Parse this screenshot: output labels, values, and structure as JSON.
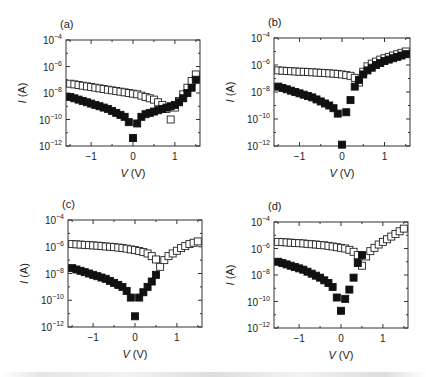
{
  "figure": {
    "panels": [
      {
        "id": "a",
        "label": "(a)"
      },
      {
        "id": "b",
        "label": "(b)"
      },
      {
        "id": "c",
        "label": "(c)"
      },
      {
        "id": "d",
        "label": "(d)"
      }
    ],
    "xlabel": "V (V)",
    "ylabel": "I (A)",
    "x_ticks": [
      "−1",
      "0",
      "1"
    ],
    "y_ticks": [
      "10⁻¹²",
      "10⁻¹⁰",
      "10⁻⁸",
      "10⁻⁶",
      "10⁻⁴"
    ],
    "colors": {
      "axis": "#222222",
      "filled_marker": "#111111",
      "open_marker_stroke": "#222222",
      "open_marker_fill": "#ffffff"
    }
  },
  "chart_data": [
    {
      "panel": "(a)",
      "type": "scatter",
      "title": "(a)",
      "xlabel": "V (V)",
      "ylabel": "I (A)",
      "yscale": "log",
      "xlim": [
        -1.6,
        1.6
      ],
      "ylim": [
        1e-12,
        0.0001
      ],
      "x_ticks": [
        -1,
        0,
        1
      ],
      "y_ticks": [
        1e-12,
        1e-10,
        1e-08,
        1e-06,
        0.0001
      ],
      "grid": false,
      "series": [
        {
          "name": "open squares",
          "marker": "open-square",
          "x": [
            -1.5,
            -1.4,
            -1.3,
            -1.2,
            -1.1,
            -1.0,
            -0.9,
            -0.8,
            -0.7,
            -0.6,
            -0.5,
            -0.4,
            -0.3,
            -0.2,
            -0.1,
            0.0,
            0.1,
            0.2,
            0.3,
            0.4,
            0.5,
            0.6,
            0.7,
            0.8,
            0.9,
            1.0,
            1.1,
            1.2,
            1.3,
            1.4,
            1.5
          ],
          "log10_y": [
            -7.3,
            -7.35,
            -7.4,
            -7.45,
            -7.5,
            -7.55,
            -7.6,
            -7.65,
            -7.7,
            -7.75,
            -7.8,
            -7.85,
            -7.9,
            -7.95,
            -8.0,
            -8.05,
            -8.1,
            -8.2,
            -8.3,
            -8.4,
            -8.5,
            -8.7,
            -8.9,
            -9.2,
            -10.0,
            -9.1,
            -8.6,
            -8.1,
            -7.6,
            -7.1,
            -6.6
          ]
        },
        {
          "name": "filled squares",
          "marker": "filled-square",
          "x": [
            -1.5,
            -1.4,
            -1.3,
            -1.2,
            -1.1,
            -1.0,
            -0.9,
            -0.8,
            -0.7,
            -0.6,
            -0.5,
            -0.4,
            -0.3,
            -0.2,
            -0.1,
            0.0,
            0.1,
            0.2,
            0.3,
            0.4,
            0.5,
            0.6,
            0.7,
            0.8,
            0.9,
            1.0,
            1.1,
            1.2,
            1.3,
            1.4,
            1.5
          ],
          "log10_y": [
            -8.3,
            -8.4,
            -8.5,
            -8.6,
            -8.7,
            -8.8,
            -8.9,
            -9.0,
            -9.1,
            -9.2,
            -9.35,
            -9.5,
            -9.65,
            -9.8,
            -10.2,
            -11.4,
            -10.3,
            -9.8,
            -9.6,
            -9.5,
            -9.4,
            -9.3,
            -9.2,
            -9.1,
            -9.0,
            -8.9,
            -8.7,
            -8.4,
            -8.0,
            -7.6,
            -7.0
          ]
        }
      ]
    },
    {
      "panel": "(b)",
      "type": "scatter",
      "title": "(b)",
      "xlabel": "V (V)",
      "ylabel": "I (A)",
      "yscale": "log",
      "xlim": [
        -1.6,
        1.6
      ],
      "ylim": [
        1e-12,
        0.0001
      ],
      "x_ticks": [
        -1,
        0,
        1
      ],
      "y_ticks": [
        1e-12,
        1e-10,
        1e-08,
        1e-06,
        0.0001
      ],
      "grid": false,
      "series": [
        {
          "name": "open squares",
          "marker": "open-square",
          "x": [
            -1.5,
            -1.4,
            -1.3,
            -1.2,
            -1.1,
            -1.0,
            -0.9,
            -0.8,
            -0.7,
            -0.6,
            -0.5,
            -0.4,
            -0.3,
            -0.2,
            -0.1,
            0.0,
            0.1,
            0.2,
            0.3,
            0.4,
            0.5,
            0.6,
            0.7,
            0.8,
            0.9,
            1.0,
            1.1,
            1.2,
            1.3,
            1.4,
            1.5
          ],
          "log10_y": [
            -6.4,
            -6.42,
            -6.44,
            -6.46,
            -6.48,
            -6.5,
            -6.5,
            -6.52,
            -6.54,
            -6.56,
            -6.58,
            -6.6,
            -6.62,
            -6.64,
            -6.66,
            -6.7,
            -6.75,
            -6.8,
            -6.95,
            -7.3,
            -6.5,
            -6.1,
            -5.9,
            -5.75,
            -5.6,
            -5.5,
            -5.4,
            -5.3,
            -5.2,
            -5.1,
            -5.0
          ]
        },
        {
          "name": "filled squares",
          "marker": "filled-square",
          "x": [
            -1.5,
            -1.4,
            -1.3,
            -1.2,
            -1.1,
            -1.0,
            -0.9,
            -0.8,
            -0.7,
            -0.6,
            -0.5,
            -0.4,
            -0.3,
            -0.2,
            -0.1,
            0.0,
            0.1,
            0.2,
            0.3,
            0.4,
            0.5,
            0.6,
            0.7,
            0.8,
            0.9,
            1.0,
            1.1,
            1.2,
            1.3,
            1.4,
            1.5
          ],
          "log10_y": [
            -7.6,
            -7.7,
            -7.8,
            -7.9,
            -8.0,
            -8.1,
            -8.2,
            -8.3,
            -8.4,
            -8.55,
            -8.7,
            -8.85,
            -9.0,
            -9.2,
            -9.6,
            -11.9,
            -9.5,
            -8.6,
            -7.6,
            -7.1,
            -6.7,
            -6.4,
            -6.2,
            -6.0,
            -5.85,
            -5.7,
            -5.6,
            -5.5,
            -5.4,
            -5.3,
            -5.2
          ]
        }
      ]
    },
    {
      "panel": "(c)",
      "type": "scatter",
      "title": "(c)",
      "xlabel": "V (V)",
      "ylabel": "I (A)",
      "yscale": "log",
      "xlim": [
        -1.6,
        1.6
      ],
      "ylim": [
        1e-12,
        0.0001
      ],
      "x_ticks": [
        -1,
        0,
        1
      ],
      "y_ticks": [
        1e-12,
        1e-10,
        1e-08,
        1e-06,
        0.0001
      ],
      "grid": false,
      "series": [
        {
          "name": "open squares",
          "marker": "open-square",
          "x": [
            -1.5,
            -1.4,
            -1.3,
            -1.2,
            -1.1,
            -1.0,
            -0.9,
            -0.8,
            -0.7,
            -0.6,
            -0.5,
            -0.4,
            -0.3,
            -0.2,
            -0.1,
            0.0,
            0.1,
            0.2,
            0.3,
            0.4,
            0.5,
            0.6,
            0.7,
            0.8,
            0.9,
            1.0,
            1.1,
            1.2,
            1.3,
            1.4,
            1.5
          ],
          "log10_y": [
            -5.8,
            -5.82,
            -5.84,
            -5.86,
            -5.88,
            -5.9,
            -5.92,
            -5.95,
            -5.98,
            -6.0,
            -6.03,
            -6.06,
            -6.1,
            -6.14,
            -6.2,
            -6.25,
            -6.32,
            -6.4,
            -6.5,
            -6.7,
            -6.95,
            -7.5,
            -7.0,
            -6.7,
            -6.5,
            -6.3,
            -6.1,
            -5.95,
            -5.8,
            -5.7,
            -5.6
          ]
        },
        {
          "name": "filled squares",
          "marker": "filled-square",
          "x": [
            -1.5,
            -1.4,
            -1.3,
            -1.2,
            -1.1,
            -1.0,
            -0.9,
            -0.8,
            -0.7,
            -0.6,
            -0.5,
            -0.4,
            -0.3,
            -0.2,
            -0.1,
            0.0,
            0.1,
            0.2,
            0.3,
            0.4,
            0.5
          ],
          "log10_y": [
            -7.6,
            -7.7,
            -7.8,
            -7.9,
            -8.0,
            -8.1,
            -8.2,
            -8.3,
            -8.4,
            -8.55,
            -8.7,
            -8.85,
            -9.0,
            -9.3,
            -9.8,
            -11.2,
            -9.8,
            -9.4,
            -9.0,
            -8.6,
            -8.1
          ]
        }
      ]
    },
    {
      "panel": "(d)",
      "type": "scatter",
      "title": "(d)",
      "xlabel": "V (V)",
      "ylabel": "I (A)",
      "yscale": "log",
      "xlim": [
        -1.6,
        1.6
      ],
      "ylim": [
        1e-12,
        0.0001
      ],
      "x_ticks": [
        -1,
        0,
        1
      ],
      "y_ticks": [
        1e-12,
        1e-10,
        1e-08,
        1e-06,
        0.0001
      ],
      "grid": false,
      "series": [
        {
          "name": "open squares",
          "marker": "open-square",
          "x": [
            -1.5,
            -1.4,
            -1.3,
            -1.2,
            -1.1,
            -1.0,
            -0.9,
            -0.8,
            -0.7,
            -0.6,
            -0.5,
            -0.4,
            -0.3,
            -0.2,
            -0.1,
            0.0,
            0.1,
            0.2,
            0.3,
            0.4,
            0.5,
            0.6,
            0.7,
            0.8,
            0.9,
            1.0,
            1.1,
            1.2,
            1.3,
            1.4,
            1.5
          ],
          "log10_y": [
            -5.5,
            -5.52,
            -5.54,
            -5.56,
            -5.58,
            -5.6,
            -5.62,
            -5.65,
            -5.68,
            -5.7,
            -5.73,
            -5.76,
            -5.8,
            -5.85,
            -5.9,
            -5.95,
            -6.0,
            -6.1,
            -6.25,
            -6.5,
            -7.3,
            -6.6,
            -6.2,
            -5.95,
            -5.7,
            -5.5,
            -5.3,
            -5.1,
            -4.9,
            -4.7,
            -4.5
          ]
        },
        {
          "name": "filled squares",
          "marker": "filled-square",
          "x": [
            -1.5,
            -1.4,
            -1.3,
            -1.2,
            -1.1,
            -1.0,
            -0.9,
            -0.8,
            -0.7,
            -0.6,
            -0.5,
            -0.4,
            -0.3,
            -0.2,
            -0.1,
            0.0,
            0.1,
            0.2,
            0.3,
            0.4,
            0.5
          ],
          "log10_y": [
            -7.0,
            -7.1,
            -7.2,
            -7.3,
            -7.4,
            -7.5,
            -7.6,
            -7.75,
            -7.9,
            -8.05,
            -8.2,
            -8.4,
            -8.6,
            -8.9,
            -9.7,
            -10.7,
            -9.8,
            -9.1,
            -8.2,
            -7.1,
            -6.5
          ]
        }
      ]
    }
  ]
}
